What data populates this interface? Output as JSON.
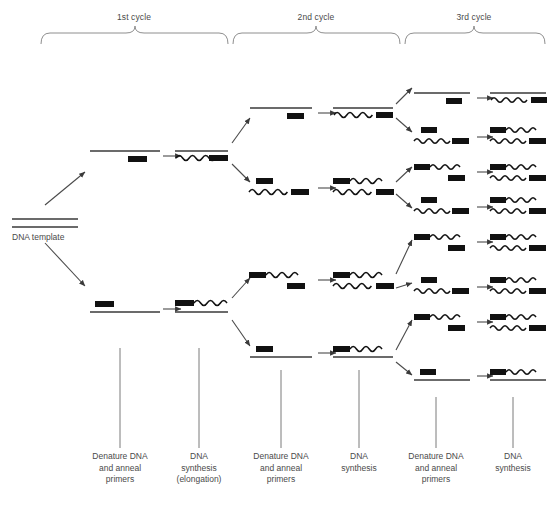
{
  "diagram": {
    "title_present": false,
    "type": "pcr-amplification-flow",
    "cycles": [
      {
        "id": "cycle1",
        "label": "1st cycle",
        "bracket_x0": 40,
        "bracket_x1": 228,
        "label_x": 134
      },
      {
        "id": "cycle2",
        "label": "2nd cycle",
        "bracket_x0": 232,
        "bracket_x1": 400,
        "label_x": 316
      },
      {
        "id": "cycle3",
        "label": "3rd cycle",
        "bracket_x0": 404,
        "bracket_x1": 545,
        "label_x": 474
      }
    ],
    "template": {
      "label": "DNA template",
      "label_x": 14,
      "label_y": 238,
      "strand_x0": 12,
      "strand_x1": 78,
      "strand_y_top": 219,
      "strand_y_bottom": 227
    },
    "step_labels": [
      {
        "id": "step-1-denature",
        "text": "Denature DNA\nand anneal\nprimers",
        "x": 120,
        "y": 455,
        "tick_x": 120,
        "tick_y0": 348,
        "tick_y1": 448
      },
      {
        "id": "step-2-synthesis",
        "text": "DNA\nsynthesis\n(elongation)",
        "x": 199,
        "y": 455,
        "tick_x": 199,
        "tick_y0": 348,
        "tick_y1": 448
      },
      {
        "id": "step-3-denature",
        "text": "Denature DNA\nand anneal\nprimers",
        "x": 281,
        "y": 455,
        "tick_x": 281,
        "tick_y0": 370,
        "tick_y1": 448
      },
      {
        "id": "step-4-synthesis",
        "text": "DNA\nsynthesis",
        "x": 359,
        "y": 455,
        "tick_x": 359,
        "tick_y0": 370,
        "tick_y1": 448
      },
      {
        "id": "step-5-denature",
        "text": "Denature DNA\nand anneal\nprimers",
        "x": 436,
        "y": 455,
        "tick_x": 436,
        "tick_y0": 397,
        "tick_y1": 448
      },
      {
        "id": "step-6-synthesis",
        "text": "DNA\nsynthesis",
        "x": 513,
        "y": 455,
        "tick_x": 513,
        "tick_y0": 397,
        "tick_y1": 448
      }
    ],
    "legend_semantics": {
      "straight_line": "original DNA template strand",
      "wavy_line": "newly synthesized DNA strand",
      "black_block": "primer"
    },
    "reaction_rows": [
      {
        "id": "c1-upper",
        "cycle": 1,
        "y": 152,
        "denatured": {
          "x0": 90,
          "x1": 160,
          "strand": "straight",
          "primer_side": "right",
          "primer_pos": "below"
        },
        "arrow": {
          "x0": 166,
          "x1": 182
        },
        "product": {
          "x0": 175,
          "x1": 228,
          "top": "straight",
          "bottom": "wavy-right-block"
        }
      },
      {
        "id": "c1-lower",
        "cycle": 1,
        "y": 306,
        "denatured": {
          "x0": 90,
          "x1": 160,
          "strand": "straight",
          "primer_side": "left",
          "primer_pos": "above"
        },
        "arrow": {
          "x0": 166,
          "x1": 182
        },
        "product": {
          "x0": 175,
          "x1": 228,
          "top": "block-wavy-right",
          "bottom": "straight"
        }
      },
      {
        "id": "c2-row1",
        "cycle": 2,
        "y": 110,
        "denatured": {
          "x0": 248,
          "x1": 310,
          "strand": "straight",
          "primer_side": "right",
          "primer_pos": "below"
        },
        "arrow": {
          "x0": 316,
          "x1": 332
        },
        "product": {
          "x0": 330,
          "x1": 395
        }
      },
      {
        "id": "c2-row2",
        "cycle": 2,
        "y": 186,
        "denatured": {
          "x0": 248,
          "x1": 310,
          "strand": "wavy",
          "primer_side": "left",
          "primer_pos": "above"
        },
        "arrow": {
          "x0": 316,
          "x1": 332
        },
        "product": {
          "x0": 330,
          "x1": 395
        }
      },
      {
        "id": "c2-row3",
        "cycle": 2,
        "y": 278,
        "denatured": {
          "x0": 248,
          "x1": 310,
          "strand": "wavy",
          "primer_side": "right",
          "primer_pos": "below"
        },
        "arrow": {
          "x0": 316,
          "x1": 332
        },
        "product": {
          "x0": 330,
          "x1": 395
        }
      },
      {
        "id": "c2-row4",
        "cycle": 2,
        "y": 352,
        "denatured": {
          "x0": 248,
          "x1": 310,
          "strand": "straight",
          "primer_side": "left",
          "primer_pos": "above"
        },
        "arrow": {
          "x0": 316,
          "x1": 332
        },
        "product": {
          "x0": 330,
          "x1": 395
        }
      },
      {
        "id": "c3-row1",
        "cycle": 3,
        "y": 95
      },
      {
        "id": "c3-row2",
        "cycle": 3,
        "y": 135
      },
      {
        "id": "c3-row3",
        "cycle": 3,
        "y": 170
      },
      {
        "id": "c3-row4",
        "cycle": 3,
        "y": 205
      },
      {
        "id": "c3-row5",
        "cycle": 3,
        "y": 240
      },
      {
        "id": "c3-row6",
        "cycle": 3,
        "y": 285
      },
      {
        "id": "c3-row7",
        "cycle": 3,
        "y": 320
      },
      {
        "id": "c3-row8",
        "cycle": 3,
        "y": 375
      }
    ],
    "colors": {
      "line": "#4a4a4a",
      "block": "#111111",
      "text": "#4a4a4a",
      "bracket": "#8e8e8e",
      "background": "#ffffff"
    }
  }
}
